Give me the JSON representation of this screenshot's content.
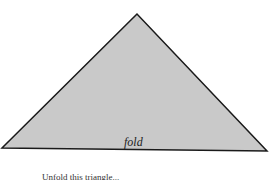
{
  "diagram": {
    "shape": "triangle",
    "fill_color": "#c9c9c9",
    "stroke_color": "#1a1a1a",
    "vertices": [
      [
        137,
        14
      ],
      [
        2,
        148
      ],
      [
        267,
        151
      ]
    ],
    "edge_label": "fold",
    "caption_partial": "Unfold this triangle..."
  }
}
